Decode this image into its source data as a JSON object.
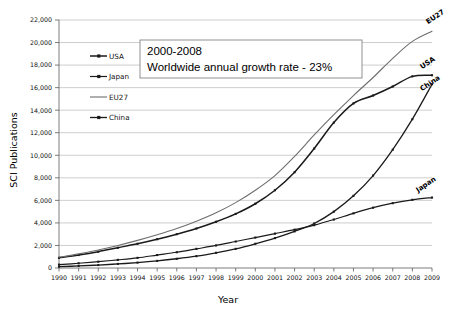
{
  "chart_data": {
    "type": "line",
    "title": "",
    "xlabel": "Year",
    "ylabel": "SCI  Publications",
    "xlim": [
      1990,
      2009
    ],
    "ylim": [
      0,
      22000
    ],
    "ytick_step": 2000,
    "grid": true,
    "legend_position": "upper-left-inside",
    "x": [
      1990,
      1991,
      1992,
      1993,
      1994,
      1995,
      1996,
      1997,
      1998,
      1999,
      2000,
      2001,
      2002,
      2003,
      2004,
      2005,
      2006,
      2007,
      2008,
      2009
    ],
    "categories": [
      "1990",
      "1991",
      "1992",
      "1993",
      "1994",
      "1995",
      "1996",
      "1997",
      "1998",
      "1999",
      "2000",
      "2001",
      "2002",
      "2003",
      "2004",
      "2005",
      "2006",
      "2007",
      "2008",
      "2009"
    ],
    "ytick_labels": [
      "0",
      "2,000",
      "4,000",
      "6,000",
      "8,000",
      "10,000",
      "12,000",
      "14,000",
      "16,000",
      "18,000",
      "20,000",
      "22,000"
    ],
    "ytick_values": [
      0,
      2000,
      4000,
      6000,
      8000,
      10000,
      12000,
      14000,
      16000,
      18000,
      20000,
      22000
    ],
    "series": [
      {
        "name": "USA",
        "color": "#1a1a1a",
        "marker": "square",
        "width": 1.5,
        "end_label": "USA",
        "values": [
          900,
          1150,
          1450,
          1800,
          2150,
          2550,
          3000,
          3500,
          4100,
          4800,
          5700,
          6900,
          8500,
          10600,
          12900,
          14600,
          15300,
          16100,
          17000,
          17100
        ]
      },
      {
        "name": "Japan",
        "color": "#1a1a1a",
        "marker": "square",
        "width": 1.2,
        "end_label": "Japan",
        "values": [
          300,
          420,
          560,
          720,
          900,
          1150,
          1400,
          1700,
          2000,
          2350,
          2700,
          3050,
          3400,
          3800,
          4300,
          4850,
          5350,
          5750,
          6050,
          6250
        ]
      },
      {
        "name": "EU27",
        "color": "#6e6e6e",
        "marker": "none",
        "width": 1.1,
        "end_label": "EU27",
        "values": [
          950,
          1250,
          1600,
          2000,
          2450,
          2950,
          3500,
          4150,
          4900,
          5800,
          6900,
          8200,
          9900,
          11800,
          13600,
          15300,
          16900,
          18600,
          20100,
          21000
        ]
      },
      {
        "name": "China",
        "color": "#1a1a1a",
        "marker": "square",
        "width": 1.3,
        "end_label": "China",
        "values": [
          120,
          180,
          260,
          360,
          480,
          630,
          820,
          1050,
          1350,
          1700,
          2150,
          2650,
          3250,
          3950,
          5000,
          6400,
          8200,
          10500,
          13200,
          16300
        ]
      }
    ],
    "annotation": {
      "line1": "2000-2008",
      "line2": "Worldwide annual growth rate  -   23%"
    }
  },
  "legend": {
    "items": [
      {
        "label": "USA"
      },
      {
        "label": "Japan"
      },
      {
        "label": "EU27"
      },
      {
        "label": "China"
      }
    ]
  }
}
